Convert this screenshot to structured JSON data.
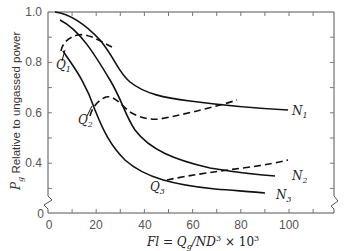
{
  "chart_data": {
    "type": "line",
    "title": "",
    "xlabel": "Fl = Qg/ND^3 × 10^3",
    "ylabel": "Pg Relative to ungassed power",
    "xlim": [
      0,
      118
    ],
    "ylim": [
      0,
      1.0
    ],
    "y_axis_break": true,
    "x_ticks": [
      "0",
      "20",
      "40",
      "60",
      "80",
      "100"
    ],
    "y_ticks": [
      "0",
      "0.4",
      "0.6",
      "0.8",
      "1.0"
    ],
    "grid": false,
    "series": [
      {
        "name": "N1",
        "style": "solid",
        "x": [
          0,
          5,
          10,
          15,
          20,
          25,
          30,
          35,
          40,
          50,
          60,
          80,
          100
        ],
        "y": [
          1.0,
          0.99,
          0.97,
          0.94,
          0.9,
          0.85,
          0.77,
          0.7,
          0.66,
          0.63,
          0.62,
          0.6,
          0.59
        ]
      },
      {
        "name": "N2",
        "style": "solid",
        "x": [
          2,
          5,
          10,
          15,
          20,
          25,
          30,
          35,
          40,
          50,
          60,
          80,
          100
        ],
        "y": [
          0.96,
          0.94,
          0.9,
          0.85,
          0.78,
          0.68,
          0.57,
          0.51,
          0.48,
          0.43,
          0.4,
          0.37,
          0.35
        ]
      },
      {
        "name": "N3",
        "style": "solid",
        "x": [
          5,
          10,
          15,
          20,
          25,
          30,
          40,
          50,
          60,
          80,
          95
        ],
        "y": [
          0.84,
          0.78,
          0.7,
          0.6,
          0.51,
          0.44,
          0.37,
          0.33,
          0.31,
          0.29,
          0.28
        ]
      },
      {
        "name": "Q1",
        "style": "dashed",
        "x": [
          5,
          8,
          12,
          18,
          25,
          30
        ],
        "y": [
          0.84,
          0.88,
          0.89,
          0.88,
          0.86,
          0.84
        ]
      },
      {
        "name": "Q2",
        "style": "dashed",
        "x": [
          13,
          16,
          20,
          25,
          30,
          35,
          40,
          45,
          50,
          60,
          70,
          78
        ],
        "y": [
          0.62,
          0.65,
          0.66,
          0.64,
          0.59,
          0.57,
          0.56,
          0.57,
          0.58,
          0.6,
          0.62,
          0.64
        ]
      },
      {
        "name": "Q3",
        "style": "dashed",
        "x": [
          41,
          50,
          60,
          70,
          80,
          90,
          100
        ],
        "y": [
          0.32,
          0.34,
          0.35,
          0.36,
          0.37,
          0.38,
          0.4
        ]
      }
    ],
    "annotations": [
      "Q1",
      "Q2",
      "Q3",
      "N1",
      "N2",
      "N3"
    ]
  },
  "axes": {
    "xlabel_parts": {
      "a": "Fl",
      "eq": " = ",
      "q": "Q",
      "qsub": "g",
      "rest": "/ND",
      "exp": "3",
      "times": " × 10",
      "exp2": "3"
    },
    "ylabel_parts": {
      "p": "P",
      "psub": "g",
      "rest": " Relative to ungassed power"
    }
  },
  "labels": {
    "q1": "Q",
    "q1sub": "1",
    "q2": "Q",
    "q2sub": "2",
    "q3": "Q",
    "q3sub": "3",
    "n1": "N",
    "n1sub": "1",
    "n2": "N",
    "n2sub": "2",
    "n3": "N",
    "n3sub": "3"
  },
  "ticks": {
    "x": [
      "0",
      "20",
      "40",
      "60",
      "80",
      "100"
    ],
    "y": [
      "1.0",
      "0.8",
      "0.6",
      "0.4",
      "0"
    ]
  }
}
